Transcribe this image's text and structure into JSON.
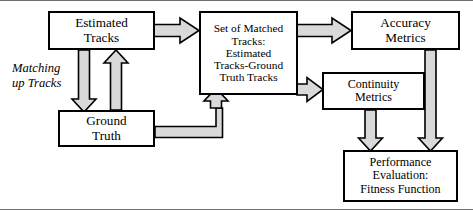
{
  "diagram": {
    "colors": {
      "arrow_fill": "#d9d9d9",
      "arrow_stroke": "#000000",
      "box_stroke": "#000000",
      "box_fill": "#ffffff",
      "frame_line": "#6f6f6f",
      "text": "#000000"
    },
    "side_label": {
      "text": "Matching\nup Tracks"
    },
    "nodes": [
      {
        "id": "estimated-tracks",
        "label": "Estimated\nTracks"
      },
      {
        "id": "matched-tracks",
        "label": "Set of  Matched\nTracks:\nEstimated\nTracks-Ground\nTruth Tracks"
      },
      {
        "id": "accuracy-metrics",
        "label": "Accuracy\nMetrics"
      },
      {
        "id": "continuity-metrics",
        "label": "Continuity\nMetrics"
      },
      {
        "id": "ground-truth",
        "label": "Ground\nTruth"
      },
      {
        "id": "performance-evaluation",
        "label": "Performance\nEvaluation:\nFitness Function"
      }
    ],
    "edges": [
      {
        "id": "estimated-to-matched",
        "from": "estimated-tracks",
        "to": "matched-tracks",
        "direction": "right"
      },
      {
        "id": "estimated-to-ground",
        "from": "estimated-tracks",
        "to": "ground-truth",
        "direction": "down"
      },
      {
        "id": "ground-to-estimated",
        "from": "ground-truth",
        "to": "estimated-tracks",
        "direction": "up"
      },
      {
        "id": "ground-to-matched",
        "from": "ground-truth",
        "to": "matched-tracks",
        "direction": "elbow-right-up"
      },
      {
        "id": "matched-to-accuracy",
        "from": "matched-tracks",
        "to": "accuracy-metrics",
        "direction": "right"
      },
      {
        "id": "matched-to-continuity",
        "from": "matched-tracks",
        "to": "continuity-metrics",
        "direction": "right"
      },
      {
        "id": "continuity-to-performance",
        "from": "continuity-metrics",
        "to": "performance-evaluation",
        "direction": "down"
      },
      {
        "id": "accuracy-to-performance",
        "from": "accuracy-metrics",
        "to": "performance-evaluation",
        "direction": "down"
      }
    ]
  }
}
